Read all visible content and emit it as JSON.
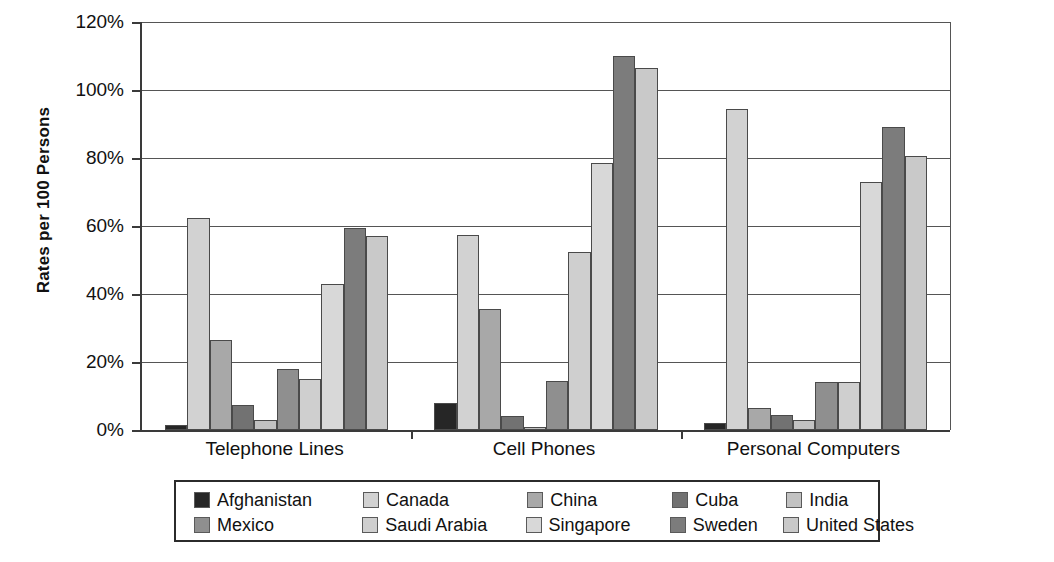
{
  "chart_data": {
    "type": "bar",
    "title": "",
    "xlabel": "",
    "ylabel": "Rates per 100 Persons",
    "categories": [
      "Telephone Lines",
      "Cell Phones",
      "Personal Computers"
    ],
    "ylim": [
      0,
      120
    ],
    "ytick_labels": [
      "0%",
      "20%",
      "40%",
      "60%",
      "80%",
      "100%",
      "120%"
    ],
    "ytick_values": [
      0,
      20,
      40,
      60,
      80,
      100,
      120
    ],
    "grid": true,
    "legend_position": "bottom",
    "series": [
      {
        "name": "Afghanistan",
        "color": "#262626",
        "values": [
          1.5,
          8.0,
          2.0
        ]
      },
      {
        "name": "Canada",
        "color": "#d2d2d2",
        "values": [
          62.5,
          57.5,
          94.5
        ]
      },
      {
        "name": "China",
        "color": "#a8a8a8",
        "values": [
          26.5,
          35.5,
          6.5
        ]
      },
      {
        "name": "Cuba",
        "color": "#727272",
        "values": [
          7.5,
          4.0,
          4.5
        ]
      },
      {
        "name": "India",
        "color": "#c2c2c2",
        "values": [
          3.0,
          1.0,
          3.0
        ]
      },
      {
        "name": "Mexico",
        "color": "#8f8f8f",
        "values": [
          18.0,
          14.5,
          14.0
        ]
      },
      {
        "name": "Saudi Arabia",
        "color": "#cfcfcf",
        "values": [
          15.0,
          52.5,
          14.0
        ]
      },
      {
        "name": "Singapore",
        "color": "#d8d8d8",
        "values": [
          43.0,
          78.5,
          73.0
        ]
      },
      {
        "name": "Sweden",
        "color": "#7c7c7c",
        "values": [
          59.5,
          110.0,
          89.0
        ]
      },
      {
        "name": "United States",
        "color": "#c9c9c9",
        "values": [
          57.0,
          106.5,
          80.5
        ]
      }
    ]
  },
  "legend": {
    "rows": [
      [
        "Afghanistan",
        "Canada",
        "China",
        "Cuba",
        "India"
      ],
      [
        "Mexico",
        "Saudi Arabia",
        "Singapore",
        "Sweden",
        "United States"
      ]
    ]
  }
}
